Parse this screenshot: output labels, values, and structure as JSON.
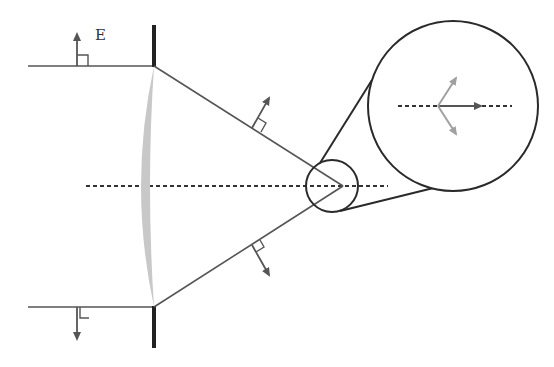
{
  "diagram": {
    "labels": {
      "field": "E"
    },
    "colors": {
      "ray": "#555555",
      "barrier": "#2a2a2a",
      "lens_fill": "#c8c8c8",
      "arrow_dark": "#555555",
      "arrow_light": "#a0a0a0",
      "circle": "#2a2a2a",
      "axis": "#333333"
    },
    "elements": [
      "incoming-ray-top",
      "incoming-ray-bottom",
      "aperture-barrier-top",
      "aperture-barrier-bottom",
      "lens",
      "optical-axis",
      "converging-ray-top",
      "converging-ray-bottom",
      "field-vector-arrows",
      "focal-region-circle",
      "magnified-inset-circle"
    ]
  }
}
